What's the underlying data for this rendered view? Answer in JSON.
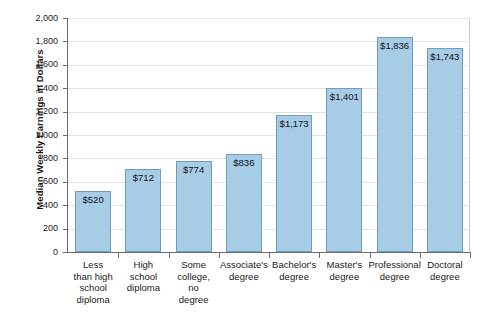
{
  "chart_data": {
    "type": "bar",
    "title": "",
    "xlabel": "",
    "ylabel": "Median Weekly Earnings in Dollars",
    "ylim": [
      0,
      2000
    ],
    "ytick_step": 200,
    "grid": true,
    "legend": "none",
    "categories": [
      "Less than high school diploma",
      "High school diploma",
      "Some college, no degree",
      "Associate's degree",
      "Bachelor's degree",
      "Master's degree",
      "Professional degree",
      "Doctoral degree"
    ],
    "category_label_lines": [
      [
        "Less",
        "than high",
        "school",
        "diploma"
      ],
      [
        "High",
        "school",
        "diploma"
      ],
      [
        "Some",
        "college,",
        "no",
        "degree"
      ],
      [
        "Associate's",
        "degree"
      ],
      [
        "Bachelor's",
        "degree"
      ],
      [
        "Master's",
        "degree"
      ],
      [
        "Professional",
        "degree"
      ],
      [
        "Doctoral",
        "degree"
      ]
    ],
    "values": [
      520,
      712,
      774,
      836,
      1173,
      1401,
      1836,
      1743
    ],
    "data_labels": [
      "$520",
      "$712",
      "$774",
      "$836",
      "$1,173",
      "$1,401",
      "$1,836",
      "$1,743"
    ],
    "ytick_labels": [
      "2,000",
      "1,800",
      "1,600",
      "1,400",
      "1,200",
      "1,000",
      "800",
      "600",
      "400",
      "200",
      "0"
    ],
    "ytick_values": [
      2000,
      1800,
      1600,
      1400,
      1200,
      1000,
      800,
      600,
      400,
      200,
      0
    ],
    "colors": {
      "bar_fill": "#a7cce6",
      "bar_border": "#6f9cbf",
      "gridline": "#e2e2e2",
      "axis": "#6b6b6b",
      "text": "#1a1a1a",
      "background": "#ffffff"
    }
  },
  "footer": {
    "caption": ""
  }
}
